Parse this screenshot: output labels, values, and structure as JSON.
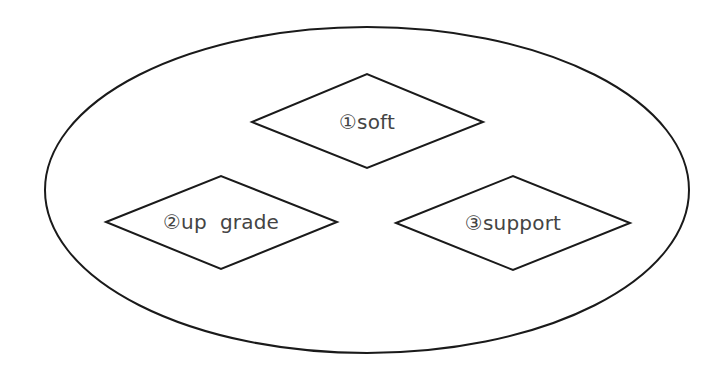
{
  "diagram": {
    "container": {
      "shape": "ellipse",
      "cx": 367,
      "cy": 190,
      "rx": 322,
      "ry": 163
    },
    "nodes": [
      {
        "id": "soft",
        "shape": "diamond",
        "label": "①soft",
        "points": "252,122 367,74 483,122 367,168",
        "text_x": 367,
        "text_y": 129
      },
      {
        "id": "upgrade",
        "shape": "diamond",
        "label": "②up  grade",
        "points": "106,222 221,176 337,222 221,269",
        "text_x": 221,
        "text_y": 229
      },
      {
        "id": "support",
        "shape": "diamond",
        "label": "③support",
        "points": "396,223 513,176 630,223 513,270",
        "text_x": 513,
        "text_y": 230
      }
    ],
    "colors": {
      "stroke": "#1a1a1a",
      "text": "#444444",
      "background": "#ffffff"
    }
  }
}
